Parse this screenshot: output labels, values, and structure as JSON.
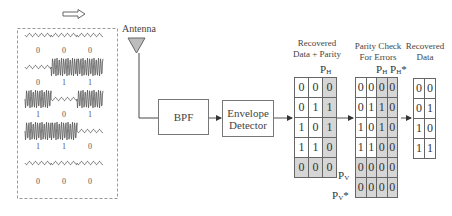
{
  "direction_arrow": "right",
  "transmitter_panel": {
    "rows": [
      {
        "bits": [
          "0",
          "0",
          "0"
        ],
        "waveform": [
          "low",
          "low",
          "low"
        ]
      },
      {
        "bits": [
          "0",
          "1",
          "1"
        ],
        "waveform": [
          "low",
          "high",
          "high"
        ]
      },
      {
        "bits": [
          "1",
          "0",
          "1"
        ],
        "waveform": [
          "high",
          "low",
          "high"
        ]
      },
      {
        "bits": [
          "1",
          "1",
          "0"
        ],
        "waveform": [
          "high",
          "high",
          "low"
        ]
      },
      {
        "bits": [
          "0",
          "0",
          "0"
        ],
        "waveform": [
          "low",
          "low",
          "low"
        ]
      }
    ]
  },
  "antenna": {
    "label": "Antenna"
  },
  "blocks": {
    "bpf": {
      "label": "BPF"
    },
    "envelope_detector": {
      "line1": "Envelope",
      "line2": "Detector"
    }
  },
  "recovered_data_parity": {
    "title_line1": "Recovered",
    "title_line2": "Data + Parity",
    "ph_label": {
      "main": "P",
      "sub": "H"
    },
    "rows": [
      [
        "0",
        "0",
        "0"
      ],
      [
        "0",
        "1",
        "1"
      ],
      [
        "1",
        "0",
        "1"
      ],
      [
        "1",
        "1",
        "0"
      ],
      [
        "0",
        "0",
        "0"
      ]
    ]
  },
  "parity_check": {
    "title_line1": "Parity Check",
    "title_line2": "For Errors",
    "ph_label": {
      "main": "P",
      "sub": "H"
    },
    "ph_star_label": {
      "main": "P",
      "sub": "H",
      "star": "*"
    },
    "pv_label": {
      "main": "P",
      "sub": "V"
    },
    "pv_star_label": {
      "main": "P",
      "sub": "V",
      "star": "*"
    },
    "rows": [
      [
        "0",
        "0",
        "0",
        "0"
      ],
      [
        "0",
        "1",
        "1",
        "0"
      ],
      [
        "1",
        "0",
        "1",
        "0"
      ],
      [
        "1",
        "1",
        "0",
        "0"
      ],
      [
        "0",
        "0",
        "0",
        "0"
      ],
      [
        "0",
        "0",
        "0",
        "0"
      ]
    ]
  },
  "recovered_data": {
    "title_line1": "Recovered",
    "title_line2": "Data",
    "rows": [
      [
        "0",
        "0"
      ],
      [
        "0",
        "1"
      ],
      [
        "1",
        "0"
      ],
      [
        "1",
        "1"
      ]
    ]
  },
  "colors": {
    "shade": "#d6d6d6",
    "line": "#666666",
    "antenna_fill": "#bdbdbd",
    "waveform": "#555555"
  }
}
